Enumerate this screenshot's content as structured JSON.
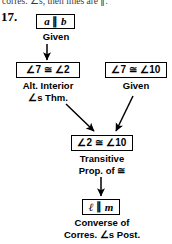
{
  "page": {
    "clipped_header_text": "corres. ∠s, then lines are ∥.",
    "problem_number": "17."
  },
  "diagram": {
    "type": "flow-proof",
    "nodes": [
      {
        "id": "given-a-par-b",
        "statement_left": "a",
        "statement_symbol": "∥",
        "statement_right": "b",
        "statement_full": "a ∥ b",
        "reason": "Given"
      },
      {
        "id": "angle7-cong-angle2",
        "statement_full": "∠7 ≅ ∠2",
        "reason_line1": "Alt. Interior",
        "reason_line2": "∠s Thm.",
        "reason": "Alt. Interior ∠s Thm."
      },
      {
        "id": "angle7-cong-angle10",
        "statement_full": "∠7 ≅ ∠10",
        "reason": "Given"
      },
      {
        "id": "angle2-cong-angle10",
        "statement_full": "∠2 ≅ ∠10",
        "reason_line1": "Transitive",
        "reason_line2": "Prop. of ≅",
        "reason": "Transitive Prop. of ≅"
      },
      {
        "id": "l-par-m",
        "statement_left": "ℓ",
        "statement_symbol": "∥",
        "statement_right": "m",
        "statement_full": "ℓ ∥ m",
        "reason_line1": "Converse of",
        "reason_line2": "Corres. ∠s Post.",
        "reason": "Converse of Corres. ∠s Post."
      }
    ],
    "edges": [
      {
        "from": "given-a-par-b",
        "to": "angle7-cong-angle2",
        "style": "vertical"
      },
      {
        "from": "angle7-cong-angle2",
        "to": "angle2-cong-angle10",
        "style": "diagonal-right-down"
      },
      {
        "from": "angle7-cong-angle10",
        "to": "angle2-cong-angle10",
        "style": "diagonal-left-down"
      },
      {
        "from": "angle2-cong-angle10",
        "to": "l-par-m",
        "style": "vertical"
      }
    ],
    "colors": {
      "ink": "#000000",
      "background": "#ffffff"
    }
  }
}
